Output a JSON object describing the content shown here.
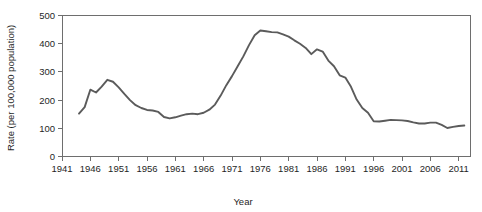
{
  "chart_data": {
    "type": "line",
    "title": "",
    "xlabel": "Year",
    "ylabel": "Rate (per 100,000 population)",
    "xlim": [
      1941,
      2013
    ],
    "ylim": [
      0,
      500
    ],
    "grid": false,
    "legend": false,
    "x_ticks": [
      1941,
      1946,
      1951,
      1956,
      1961,
      1966,
      1971,
      1976,
      1981,
      1986,
      1991,
      1996,
      2001,
      2006,
      2011
    ],
    "y_ticks": [
      0,
      100,
      200,
      300,
      400,
      500
    ],
    "line_color": "#5b5b5b",
    "series": [
      {
        "name": "Rate",
        "x": [
          1944,
          1945,
          1946,
          1947,
          1948,
          1949,
          1950,
          1951,
          1952,
          1953,
          1954,
          1955,
          1956,
          1957,
          1958,
          1959,
          1960,
          1961,
          1962,
          1963,
          1964,
          1965,
          1966,
          1967,
          1968,
          1969,
          1970,
          1971,
          1972,
          1973,
          1974,
          1975,
          1976,
          1977,
          1978,
          1979,
          1980,
          1981,
          1982,
          1983,
          1984,
          1985,
          1986,
          1987,
          1988,
          1989,
          1990,
          1991,
          1992,
          1993,
          1994,
          1995,
          1996,
          1997,
          1998,
          1999,
          2000,
          2001,
          2002,
          2003,
          2004,
          2005,
          2006,
          2007,
          2008,
          2009,
          2010,
          2011,
          2012
        ],
        "values": [
          152,
          175,
          237,
          227,
          248,
          272,
          265,
          245,
          222,
          200,
          182,
          172,
          165,
          163,
          158,
          140,
          135,
          139,
          145,
          150,
          152,
          150,
          155,
          166,
          184,
          216,
          253,
          285,
          320,
          355,
          395,
          430,
          447,
          444,
          441,
          440,
          433,
          425,
          412,
          400,
          385,
          363,
          380,
          372,
          340,
          320,
          288,
          280,
          247,
          202,
          172,
          155,
          125,
          124,
          127,
          130,
          129,
          128,
          126,
          121,
          117,
          117,
          120,
          120,
          112,
          101,
          105,
          108,
          110
        ]
      }
    ]
  }
}
